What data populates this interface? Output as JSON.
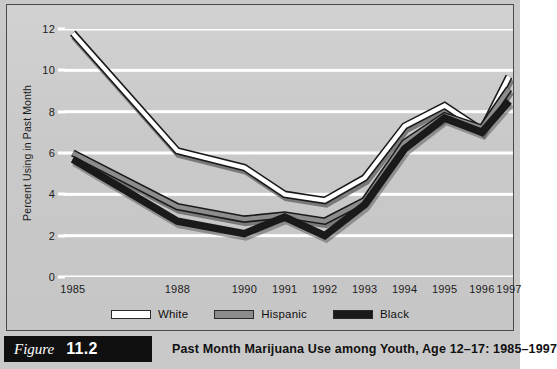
{
  "figure": {
    "label": "Figure",
    "number": "11.2",
    "caption": "Past Month Marijuana Use among Youth, Age 12–17: 1985–1997"
  },
  "colors": {
    "panel_background": "#cccccc",
    "gridline": "#ffffff",
    "series_white": "#ffffff",
    "series_hispanic": "#8c8c8c",
    "series_black": "#1a1a1a",
    "line_outline": "#1a1a1a",
    "text": "#1c1c1c",
    "caption_tab": "#101010"
  },
  "chart_data": {
    "type": "line",
    "title": "Past Month Marijuana Use among Youth, Age 12–17: 1985–1997",
    "xlabel": "",
    "ylabel": "Percent Using in Past Month",
    "categories": [
      "1985",
      "1988",
      "1990",
      "1991",
      "1992",
      "1993",
      "1994",
      "1995",
      "1996",
      "1997"
    ],
    "ylim": [
      0,
      12
    ],
    "yticks": [
      0,
      2,
      4,
      6,
      8,
      10,
      12
    ],
    "ytick_labels": [
      "0",
      "2",
      "4",
      "6",
      "8",
      "10",
      "12"
    ],
    "grid": "horizontal",
    "legend_position": "bottom",
    "series": [
      {
        "name": "White",
        "color": "#ffffff",
        "values": [
          11.8,
          6.1,
          5.3,
          4.0,
          3.7,
          4.8,
          7.3,
          8.3,
          7.1,
          9.7
        ]
      },
      {
        "name": "Hispanic",
        "color": "#8c8c8c",
        "values": [
          6.0,
          3.4,
          2.8,
          3.0,
          2.7,
          3.7,
          6.5,
          7.8,
          7.2,
          9.1
        ]
      },
      {
        "name": "Black",
        "color": "#1a1a1a",
        "values": [
          5.7,
          2.7,
          2.1,
          2.9,
          2.0,
          3.5,
          6.2,
          7.7,
          7.0,
          8.5
        ]
      }
    ]
  }
}
